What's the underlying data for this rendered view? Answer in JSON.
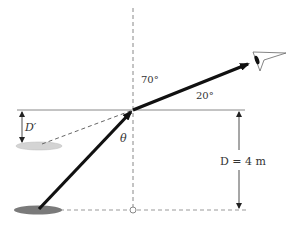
{
  "diagram": {
    "type": "optics-refraction",
    "labels": {
      "angle_above": "70°",
      "angle_surface": "20°",
      "theta": "θ",
      "apparent_depth": "D′",
      "real_depth": "D = 4 m"
    },
    "elements": {
      "water_surface": "horizontal line",
      "normal": "vertical dashed line",
      "bottom": "horizontal dashed line",
      "object_real": "dark ellipse at bottom",
      "object_apparent": "light ellipse (image)",
      "ray_in_water": "arrow from object to surface",
      "ray_in_air": "arrow from surface to eye",
      "virtual_ray": "dashed line from image to surface point",
      "eye": "observer eye"
    },
    "colors": {
      "ray": "#111111",
      "lines": "#888888",
      "object_real": "#777777",
      "object_apparent": "#cccccc",
      "text": "#333333"
    }
  }
}
